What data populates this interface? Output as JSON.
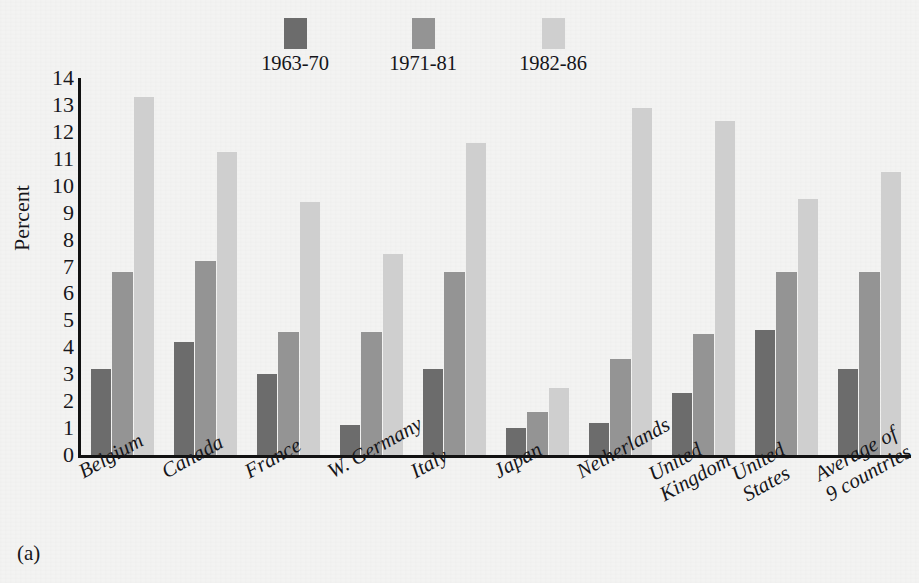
{
  "figure": {
    "panel_caption": "(a)",
    "background_color": "#f3f3f2",
    "axis_color": "#121212"
  },
  "legend": {
    "position": "top-center",
    "items": [
      {
        "label": "1963-70",
        "color": "#6c6c6c"
      },
      {
        "label": "1971-81",
        "color": "#949494"
      },
      {
        "label": "1982-86",
        "color": "#cfcfcf"
      }
    ]
  },
  "axes": {
    "y_title": "Percent",
    "y_ticks": [
      "14",
      "13",
      "12",
      "11",
      "10",
      "9",
      "8",
      "7",
      "6",
      "5",
      "4",
      "3",
      "2",
      "1",
      "0"
    ]
  },
  "chart_data": {
    "type": "bar",
    "title": "",
    "subtitle": "",
    "xlabel": "",
    "ylabel": "Percent",
    "ylim": [
      0,
      14
    ],
    "ytick_step": 1,
    "grid": false,
    "legend_position": "top-center",
    "orientation": "vertical",
    "grouped": true,
    "categories": [
      "Belgium",
      "Canada",
      "France",
      "W. Germany",
      "Italy",
      "Japan",
      "Netherlands",
      "United\nKingdom",
      "United\nStates",
      "Average of\n9 countries"
    ],
    "series": [
      {
        "name": "1963-70",
        "color": "#6c6c6c",
        "values": [
          3.2,
          4.2,
          3.0,
          1.1,
          3.2,
          1.0,
          1.2,
          2.3,
          4.65,
          3.2
        ]
      },
      {
        "name": "1971-81",
        "color": "#949494",
        "values": [
          6.8,
          7.2,
          4.55,
          4.55,
          6.8,
          1.6,
          3.55,
          4.5,
          6.8,
          6.8
        ]
      },
      {
        "name": "1982-86",
        "color": "#cfcfcf",
        "values": [
          13.3,
          11.25,
          9.4,
          7.45,
          11.6,
          2.5,
          12.9,
          12.4,
          9.5,
          10.5
        ]
      }
    ]
  }
}
